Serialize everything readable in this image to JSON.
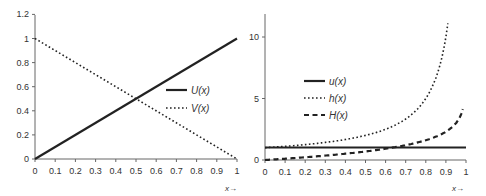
{
  "chart_data": [
    {
      "type": "line",
      "title": "",
      "xlabel": "x→",
      "ylabel": "",
      "xlim": [
        0,
        1
      ],
      "ylim": [
        0,
        1.2
      ],
      "x_ticks": [
        "0",
        "0.1",
        "0.2",
        "0.3",
        "0.4",
        "0.5",
        "0.6",
        "0.7",
        "0.8",
        "0.9",
        "1"
      ],
      "y_ticks": [
        "0",
        "0.2",
        "0.4",
        "0.6",
        "0.8",
        "1",
        "1.2"
      ],
      "grid": false,
      "legend_position": "center-right",
      "x": [
        0,
        0.1,
        0.2,
        0.3,
        0.4,
        0.5,
        0.6,
        0.7,
        0.8,
        0.9,
        1
      ],
      "series": [
        {
          "name": "U(x)",
          "style": "solid",
          "values": [
            0,
            0.1,
            0.2,
            0.3,
            0.4,
            0.5,
            0.6,
            0.7,
            0.8,
            0.9,
            1
          ]
        },
        {
          "name": "V(x)",
          "style": "dotted",
          "values": [
            1,
            0.9,
            0.8,
            0.7,
            0.6,
            0.5,
            0.4,
            0.3,
            0.2,
            0.1,
            0
          ]
        }
      ]
    },
    {
      "type": "line",
      "title": "",
      "xlabel": "x→",
      "ylabel": "",
      "xlim": [
        0,
        1
      ],
      "ylim": [
        0,
        12
      ],
      "x_ticks": [
        "0",
        "0.1",
        "0.2",
        "0.3",
        "0.4",
        "0.5",
        "0.6",
        "0.7",
        "0.8",
        "0.9",
        "1"
      ],
      "y_ticks": [
        "0",
        "5",
        "10"
      ],
      "grid": false,
      "legend_position": "center-left",
      "x": [
        0,
        0.1,
        0.2,
        0.3,
        0.4,
        0.5,
        0.6,
        0.7,
        0.8,
        0.9,
        0.92,
        0.99
      ],
      "series": [
        {
          "name": "u(x)",
          "style": "solid",
          "values": [
            1,
            1,
            1,
            1,
            1,
            1,
            1,
            1,
            1,
            1,
            1,
            1
          ]
        },
        {
          "name": "h(x)",
          "style": "dotted",
          "values": [
            1,
            1.11,
            1.25,
            1.43,
            1.67,
            2,
            2.5,
            3.33,
            5,
            10,
            12.5,
            null
          ]
        },
        {
          "name": "H(x)",
          "style": "dashed",
          "values": [
            0,
            0.11,
            0.22,
            0.36,
            0.51,
            0.69,
            0.92,
            1.2,
            1.61,
            2.3,
            2.53,
            4.6
          ]
        }
      ]
    }
  ],
  "left": {
    "y_ticks": [
      "0",
      "0.2",
      "0.4",
      "0.6",
      "0.8",
      "1",
      "1.2"
    ],
    "x_ticks": [
      "0",
      "0.1",
      "0.2",
      "0.3",
      "0.4",
      "0.5",
      "0.6",
      "0.7",
      "0.8",
      "0.9",
      "1"
    ],
    "xlabel": "x→",
    "legend": [
      "U(x)",
      "V(x)"
    ]
  },
  "right": {
    "y_ticks": [
      "0",
      "5",
      "10"
    ],
    "x_ticks": [
      "0",
      "0.1",
      "0.2",
      "0.3",
      "0.4",
      "0.5",
      "0.6",
      "0.7",
      "0.8",
      "0.9",
      "1"
    ],
    "xlabel": "x→",
    "legend": [
      "u(x)",
      "h(x)",
      "H(x)"
    ]
  },
  "colors": {
    "line": "#222222",
    "axis": "#666666",
    "text": "#333333"
  }
}
